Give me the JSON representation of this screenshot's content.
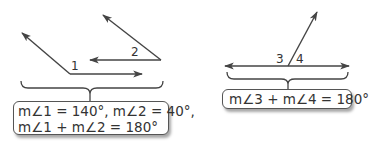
{
  "figures": [
    {
      "id": "linear-pair-separate",
      "angle_labels": [
        "1",
        "2"
      ],
      "equation_lines": [
        "m∠1 = 140°, m∠2 = 40°,",
        "m∠1 +  m∠2 = 180°"
      ]
    },
    {
      "id": "linear-pair-adjacent",
      "angle_labels": [
        "3",
        "4"
      ],
      "equation_lines": [
        "m∠3 +  m∠4 = 180°"
      ]
    }
  ],
  "colors": {
    "line": "#444444",
    "text": "#333333",
    "box_border": "#555555"
  }
}
